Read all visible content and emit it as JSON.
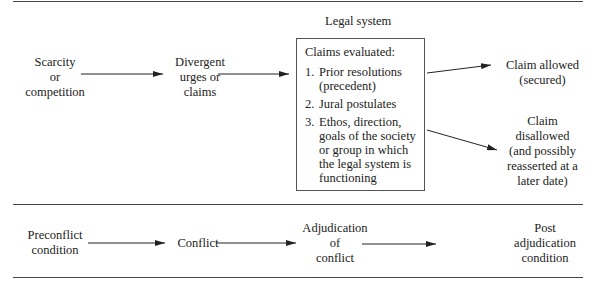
{
  "top_section": {
    "title": "Legal system",
    "nodes": {
      "scarcity": [
        "Scarcity",
        "or",
        "competition"
      ],
      "divergent": [
        "Divergent",
        "urges or",
        "claims"
      ],
      "allowed": [
        "Claim allowed",
        "(secured)"
      ],
      "disallowed": [
        "Claim",
        "disallowed",
        "(and possibly",
        "reasserted at a",
        "later date)"
      ]
    },
    "box": {
      "heading": "Claims evaluated:",
      "items": [
        {
          "num": "1.",
          "text": "Prior resolutions (precedent)"
        },
        {
          "num": "2.",
          "text": "Jural postulates"
        },
        {
          "num": "3.",
          "text": "Ethos, direction, goals of the society or group in which the legal system is functioning"
        }
      ]
    }
  },
  "bottom_section": {
    "nodes": {
      "preconflict": [
        "Preconflict",
        "condition"
      ],
      "conflict": [
        "Conflict"
      ],
      "adjudication": [
        "Adjudication",
        "of",
        "conflict"
      ],
      "post": [
        "Post",
        "adjudication",
        "condition"
      ]
    }
  },
  "colors": {
    "line": "#444444",
    "text": "#222222"
  }
}
